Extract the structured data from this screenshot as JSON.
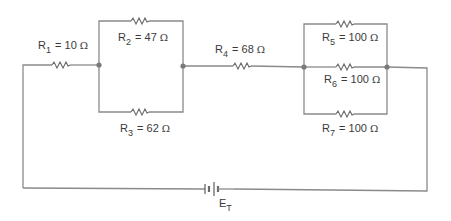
{
  "diagram": {
    "type": "circuit-schematic",
    "colors": {
      "wire": "#8a8a8a",
      "resistor": "#6a6a6a",
      "text": "#3a3a3a",
      "node": "#7a7a7a",
      "background": "#ffffff"
    },
    "resistors": [
      {
        "id": "R1",
        "symbol": "R",
        "sub": "1",
        "eq": "=",
        "value": "10",
        "unit": "Ω",
        "group": "series"
      },
      {
        "id": "R2",
        "symbol": "R",
        "sub": "2",
        "eq": "=",
        "value": "47",
        "unit": "Ω",
        "group": "parallel-A"
      },
      {
        "id": "R3",
        "symbol": "R",
        "sub": "3",
        "eq": "=",
        "value": "62",
        "unit": "Ω",
        "group": "parallel-A"
      },
      {
        "id": "R4",
        "symbol": "R",
        "sub": "4",
        "eq": "=",
        "value": "68",
        "unit": "Ω",
        "group": "series"
      },
      {
        "id": "R5",
        "symbol": "R",
        "sub": "5",
        "eq": "=",
        "value": "100",
        "unit": "Ω",
        "group": "parallel-B"
      },
      {
        "id": "R6",
        "symbol": "R",
        "sub": "6",
        "eq": "=",
        "value": "100",
        "unit": "Ω",
        "group": "parallel-B"
      },
      {
        "id": "R7",
        "symbol": "R",
        "sub": "7",
        "eq": "=",
        "value": "100",
        "unit": "Ω",
        "group": "parallel-B"
      }
    ],
    "source": {
      "id": "ET",
      "symbol": "E",
      "sub": "T"
    }
  }
}
